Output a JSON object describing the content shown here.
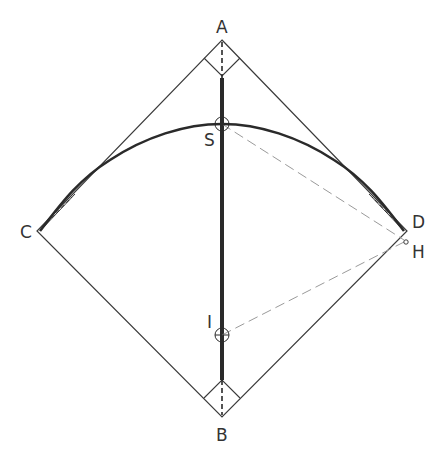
{
  "figure": {
    "type": "geometric construction diagram",
    "points": {
      "A": {
        "label": "A"
      },
      "B": {
        "label": "B"
      },
      "C": {
        "label": "C"
      },
      "D": {
        "label": "D"
      },
      "S": {
        "label": "S"
      },
      "I": {
        "label": "I"
      },
      "H": {
        "label": "H"
      }
    },
    "elements": [
      {
        "name": "square-ACBD",
        "style": "thin solid"
      },
      {
        "name": "axis-AB",
        "style": "thick solid with dashed ends"
      },
      {
        "name": "arc-through-S",
        "style": "thick solid curve"
      },
      {
        "name": "line-S-H",
        "style": "gray dashed"
      },
      {
        "name": "line-I-H",
        "style": "gray dashed"
      },
      {
        "name": "right-angle-mark-A",
        "style": "thin"
      },
      {
        "name": "right-angle-mark-B",
        "style": "thin"
      }
    ],
    "colors": {
      "ink": "#2a2a2a",
      "construction": "#9a9a9a"
    }
  }
}
